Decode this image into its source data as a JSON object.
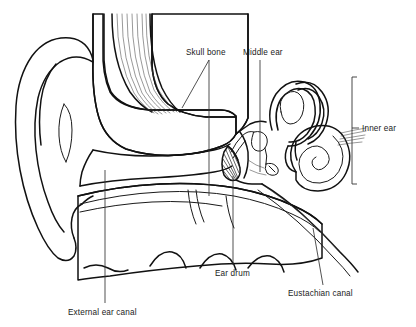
{
  "diagram": {
    "background_color": "#ffffff",
    "line_color": "#111111",
    "label_color": "#1a1a1a",
    "width": 416,
    "height": 327,
    "labels": [
      {
        "id": "skull-bone",
        "text": "Skull bone",
        "x": 186,
        "y": 55,
        "anchor": "start"
      },
      {
        "id": "middle-ear",
        "text": "Middle ear",
        "x": 243,
        "y": 55,
        "anchor": "start"
      },
      {
        "id": "inner-ear",
        "text": "Inner ear",
        "x": 362,
        "y": 128,
        "anchor": "start"
      },
      {
        "id": "ear-drum",
        "text": "Ear drum",
        "x": 215,
        "y": 273,
        "anchor": "start"
      },
      {
        "id": "eustachian-canal",
        "text": "Eustachian canal",
        "x": 288,
        "y": 293,
        "anchor": "start"
      },
      {
        "id": "external-ear-canal",
        "text": "External ear canal",
        "x": 68,
        "y": 312,
        "anchor": "start"
      }
    ],
    "parts": [
      "pinna",
      "external-ear-canal",
      "ear-drum",
      "middle-ear-ossicles",
      "semicircular-canals",
      "cochlea",
      "eustachian-canal",
      "skull-bone-mastoid",
      "temporalis-muscle"
    ]
  }
}
